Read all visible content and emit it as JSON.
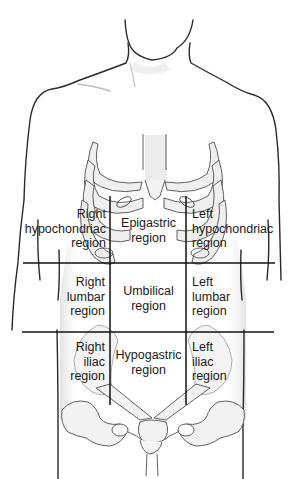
{
  "diagram": {
    "colors": {
      "outline": "#2a2a2a",
      "bone": "#ececec",
      "grid": "#111111",
      "skin_shade": "#dcdcdc"
    },
    "grid": {
      "vertical_lines_x": [
        110,
        186
      ],
      "horizontal_lines_y": [
        263,
        332
      ]
    },
    "regions": [
      {
        "id": "right-hypochondriac",
        "line1": "Right",
        "line2": "hypochondriac",
        "line3": "region"
      },
      {
        "id": "epigastric",
        "line1": "Epigastric",
        "line2": "region"
      },
      {
        "id": "left-hypochondriac",
        "line1": "Left",
        "line2": "hypochondriac",
        "line3": "region"
      },
      {
        "id": "right-lumbar",
        "line1": "Right",
        "line2": "lumbar",
        "line3": "region"
      },
      {
        "id": "umbilical",
        "line1": "Umbilical",
        "line2": "region"
      },
      {
        "id": "left-lumbar",
        "line1": "Left",
        "line2": "lumbar",
        "line3": "region"
      },
      {
        "id": "right-iliac",
        "line1": "Right",
        "line2": "iliac",
        "line3": "region"
      },
      {
        "id": "hypogastric",
        "line1": "Hypogastric",
        "line2": "region"
      },
      {
        "id": "left-iliac",
        "line1": "Left",
        "line2": "iliac",
        "line3": "region"
      }
    ]
  }
}
